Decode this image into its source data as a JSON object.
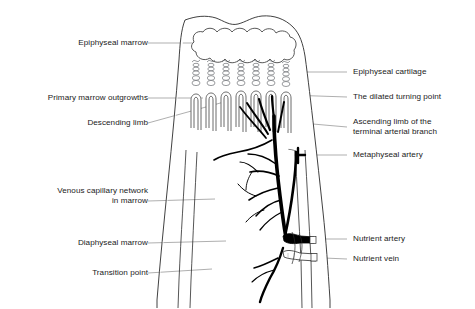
{
  "figure": {
    "background_color": "#ffffff",
    "line_color": "#2b2b2b",
    "leader_color": "#8d8d8d",
    "vessel_dark_color": "#000000",
    "text_color": "#1a1a1a"
  },
  "labels_left": [
    {
      "id": "epiphyseal-marrow",
      "text": "Epiphyseal marrow"
    },
    {
      "id": "primary-marrow-outgrowths",
      "text": "Primary marrow outgrowths"
    },
    {
      "id": "descending-limb",
      "text": "Descending limb"
    },
    {
      "id": "venous-capillary-network",
      "text": "Venous capillary network\nin marrow"
    },
    {
      "id": "diaphyseal-marrow",
      "text": "Diaphyseal marrow"
    },
    {
      "id": "transition-point",
      "text": "Transition point"
    }
  ],
  "labels_right": [
    {
      "id": "epiphyseal-cartilage",
      "text": "Epiphyseal cartilage"
    },
    {
      "id": "dilated-turning-point",
      "text": "The dilated turning point"
    },
    {
      "id": "ascending-limb",
      "text": "Ascending limb of the\nterminal arterial branch"
    },
    {
      "id": "metaphyseal-artery",
      "text": "Metaphyseal artery"
    },
    {
      "id": "nutrient-artery",
      "text": "Nutrient artery"
    },
    {
      "id": "nutrient-vein",
      "text": "Nutrient vein"
    }
  ],
  "structures": [
    {
      "id": "bone-outline",
      "name": "cortical bone outline"
    },
    {
      "id": "epiphyseal-marrow-lobes",
      "name": "lobed epiphyseal marrow cavity"
    },
    {
      "id": "cartilage-columns",
      "name": "columns of chondrocyte lacunae"
    },
    {
      "id": "capillary-loops",
      "name": "hairpin capillary loops"
    },
    {
      "id": "trabecular-network",
      "name": "cancellous trabecular bone"
    },
    {
      "id": "arterial-tree",
      "name": "branching nutrient arterial tree"
    },
    {
      "id": "nutrient-canal",
      "name": "nutrient foramen canal"
    }
  ]
}
